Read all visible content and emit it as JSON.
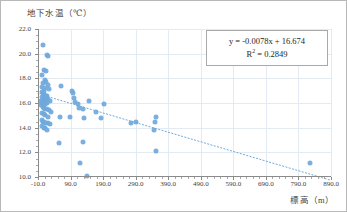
{
  "figure": {
    "y_axis_title": "地下水温（℃）",
    "x_axis_title": "標高（m）"
  },
  "equation": {
    "line": "y = -0.0078x + 16.674",
    "r2_prefix": "R",
    "r2_sup": "2",
    "r2_value": " = 0.2849"
  },
  "chart_data": {
    "type": "scatter",
    "title": "",
    "xlabel": "標高（m）",
    "ylabel": "地下水温（℃）",
    "xlim": [
      -10.0,
      890.0
    ],
    "ylim": [
      10.0,
      22.0
    ],
    "xticks": [
      -10.0,
      90.0,
      190.0,
      290.0,
      390.0,
      490.0,
      590.0,
      690.0,
      790.0,
      890.0
    ],
    "xtick_labels": [
      "-10.0",
      "90.0",
      "190.0",
      "290.0",
      "390.0",
      "490.0",
      "590.0",
      "690.0",
      "790.0",
      "890.0"
    ],
    "yticks": [
      10.0,
      12.0,
      14.0,
      16.0,
      18.0,
      20.0,
      22.0
    ],
    "ytick_labels": [
      "10.0",
      "12.0",
      "14.0",
      "16.0",
      "18.0",
      "20.0",
      "22.0"
    ],
    "grid": true,
    "legend": false,
    "marker_color": "#6fa8dc",
    "trendline": {
      "type": "linear",
      "style": "dotted",
      "color": "#6fa8dc",
      "slope": -0.0078,
      "intercept": 16.674,
      "r_squared": 0.2849,
      "equation_label": "y = -0.0078x + 16.674",
      "r2_label": "R² = 0.2849",
      "x_start": -10.0,
      "x_end": 890.0
    },
    "points": [
      [
        5,
        20.7
      ],
      [
        18,
        19.9
      ],
      [
        22,
        19.8
      ],
      [
        8,
        18.7
      ],
      [
        3,
        18.3
      ],
      [
        14,
        18.6
      ],
      [
        10,
        17.9
      ],
      [
        16,
        17.7
      ],
      [
        6,
        17.6
      ],
      [
        20,
        17.5
      ],
      [
        2,
        17.3
      ],
      [
        12,
        17.2
      ],
      [
        24,
        17.1
      ],
      [
        8,
        17.0
      ],
      [
        60,
        17.4
      ],
      [
        95,
        17.0
      ],
      [
        98,
        16.8
      ],
      [
        1,
        16.9
      ],
      [
        4,
        16.8
      ],
      [
        9,
        16.7
      ],
      [
        14,
        16.6
      ],
      [
        19,
        16.6
      ],
      [
        2,
        16.5
      ],
      [
        7,
        16.4
      ],
      [
        11,
        16.4
      ],
      [
        16,
        16.3
      ],
      [
        22,
        16.3
      ],
      [
        0,
        16.2
      ],
      [
        5,
        16.2
      ],
      [
        9,
        16.1
      ],
      [
        13,
        16.1
      ],
      [
        18,
        16.0
      ],
      [
        1,
        16.0
      ],
      [
        6,
        15.9
      ],
      [
        10,
        15.9
      ],
      [
        26,
        16.2
      ],
      [
        100,
        16.4
      ],
      [
        105,
        16.1
      ],
      [
        112,
        15.9
      ],
      [
        146,
        16.2
      ],
      [
        192,
        15.9
      ],
      [
        0,
        15.8
      ],
      [
        4,
        15.7
      ],
      [
        8,
        15.6
      ],
      [
        12,
        15.5
      ],
      [
        17,
        15.5
      ],
      [
        25,
        15.4
      ],
      [
        30,
        15.3
      ],
      [
        115,
        15.6
      ],
      [
        128,
        15.5
      ],
      [
        168,
        15.3
      ],
      [
        2,
        15.2
      ],
      [
        7,
        15.1
      ],
      [
        13,
        15.0
      ],
      [
        20,
        14.9
      ],
      [
        58,
        14.9
      ],
      [
        88,
        14.85
      ],
      [
        132,
        14.8
      ],
      [
        182,
        14.8
      ],
      [
        352,
        14.9
      ],
      [
        350,
        14.45
      ],
      [
        1,
        14.6
      ],
      [
        5,
        14.5
      ],
      [
        9,
        14.45
      ],
      [
        15,
        14.4
      ],
      [
        22,
        14.35
      ],
      [
        28,
        14.3
      ],
      [
        275,
        14.35
      ],
      [
        292,
        14.45
      ],
      [
        3,
        14.1
      ],
      [
        8,
        14.0
      ],
      [
        13,
        13.95
      ],
      [
        19,
        13.85
      ],
      [
        345,
        13.8
      ],
      [
        56,
        12.75
      ],
      [
        128,
        12.8
      ],
      [
        352,
        12.1
      ],
      [
        118,
        11.15
      ],
      [
        825,
        11.1
      ],
      [
        142,
        10.05
      ]
    ]
  }
}
